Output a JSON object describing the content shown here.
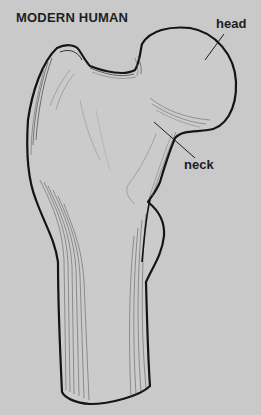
{
  "figure": {
    "title": "MODERN HUMAN",
    "labels": [
      {
        "id": "head",
        "text": "head"
      },
      {
        "id": "neck",
        "text": "neck"
      }
    ]
  },
  "colors": {
    "background": "#c9c9c9",
    "outline": "#141414",
    "hatching": "#5a5a5a",
    "text": "#1e1e1e"
  }
}
